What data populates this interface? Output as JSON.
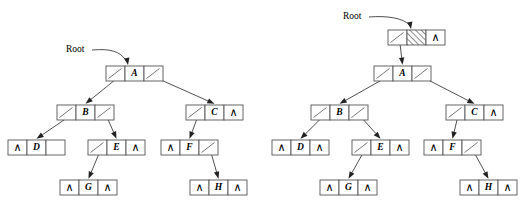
{
  "figure": {
    "nil_symbol": "∧",
    "colors": {
      "box_stroke": "#555555",
      "line": "#333333",
      "arrow": "#222222",
      "background": "#ffffff",
      "hatch": "#333333"
    }
  },
  "diagrams": [
    {
      "id": "left-tree",
      "name": "tree-without-header",
      "root_label": "Root",
      "root_label_pos": {
        "x": 66,
        "y": 50
      },
      "root_arrow": {
        "from_x": 92,
        "to_x": 128,
        "to_y": 66
      },
      "has_header_node": false,
      "nodes": [
        {
          "id": "A",
          "value": "A",
          "x": 106,
          "y": 66,
          "left": "pointer",
          "right": "pointer"
        },
        {
          "id": "B",
          "value": "B",
          "x": 57,
          "y": 105,
          "left": "pointer",
          "right": "pointer"
        },
        {
          "id": "C",
          "value": "C",
          "x": 186,
          "y": 105,
          "left": "pointer",
          "right": "nil"
        },
        {
          "id": "D",
          "value": "D",
          "x": 8,
          "y": 140,
          "left": "nil",
          "right": "empty"
        },
        {
          "id": "E",
          "value": "E",
          "x": 88,
          "y": 140,
          "left": "pointer",
          "right": "nil"
        },
        {
          "id": "F",
          "value": "F",
          "x": 161,
          "y": 140,
          "left": "nil",
          "right": "pointer"
        },
        {
          "id": "G",
          "value": "G",
          "x": 60,
          "y": 180,
          "left": "nil",
          "right": "nil"
        },
        {
          "id": "H",
          "value": "H",
          "x": 190,
          "y": 180,
          "left": "nil",
          "right": "nil"
        }
      ],
      "edges": [
        {
          "from": "A",
          "side": "left",
          "to": "B"
        },
        {
          "from": "A",
          "side": "right",
          "to": "C"
        },
        {
          "from": "B",
          "side": "left",
          "to": "D"
        },
        {
          "from": "B",
          "side": "right",
          "to": "E"
        },
        {
          "from": "C",
          "side": "left",
          "to": "F"
        },
        {
          "from": "E",
          "side": "left",
          "to": "G"
        },
        {
          "from": "F",
          "side": "right",
          "to": "H"
        }
      ]
    },
    {
      "id": "right-tree",
      "name": "tree-with-header",
      "root_label": "Root",
      "root_label_pos": {
        "x": 343,
        "y": 17
      },
      "root_arrow": {
        "from_x": 369,
        "to_x": 411,
        "to_y": 30
      },
      "has_header_node": true,
      "header_node": {
        "id": "HEADER",
        "value": "",
        "x": 388,
        "y": 30,
        "left": "pointer",
        "middle": "hatched",
        "right": "nil"
      },
      "nodes": [
        {
          "id": "A",
          "value": "A",
          "x": 374,
          "y": 66,
          "left": "pointer",
          "right": "pointer"
        },
        {
          "id": "B",
          "value": "B",
          "x": 311,
          "y": 105,
          "left": "pointer",
          "right": "pointer"
        },
        {
          "id": "C",
          "value": "C",
          "x": 446,
          "y": 105,
          "left": "pointer",
          "right": "nil"
        },
        {
          "id": "D",
          "value": "D",
          "x": 272,
          "y": 140,
          "left": "nil",
          "right": "nil"
        },
        {
          "id": "E",
          "value": "E",
          "x": 352,
          "y": 140,
          "left": "pointer",
          "right": "nil"
        },
        {
          "id": "F",
          "value": "F",
          "x": 424,
          "y": 140,
          "left": "nil",
          "right": "pointer"
        },
        {
          "id": "G",
          "value": "G",
          "x": 320,
          "y": 180,
          "left": "nil",
          "right": "nil"
        },
        {
          "id": "H",
          "value": "H",
          "x": 460,
          "y": 180,
          "left": "nil",
          "right": "nil"
        }
      ],
      "edges": [
        {
          "from": "HEADER",
          "side": "left",
          "to": "A"
        },
        {
          "from": "A",
          "side": "left",
          "to": "B"
        },
        {
          "from": "A",
          "side": "right",
          "to": "C"
        },
        {
          "from": "B",
          "side": "left",
          "to": "D"
        },
        {
          "from": "B",
          "side": "right",
          "to": "E"
        },
        {
          "from": "C",
          "side": "left",
          "to": "F"
        },
        {
          "from": "E",
          "side": "left",
          "to": "G"
        },
        {
          "from": "F",
          "side": "right",
          "to": "H"
        }
      ]
    }
  ]
}
